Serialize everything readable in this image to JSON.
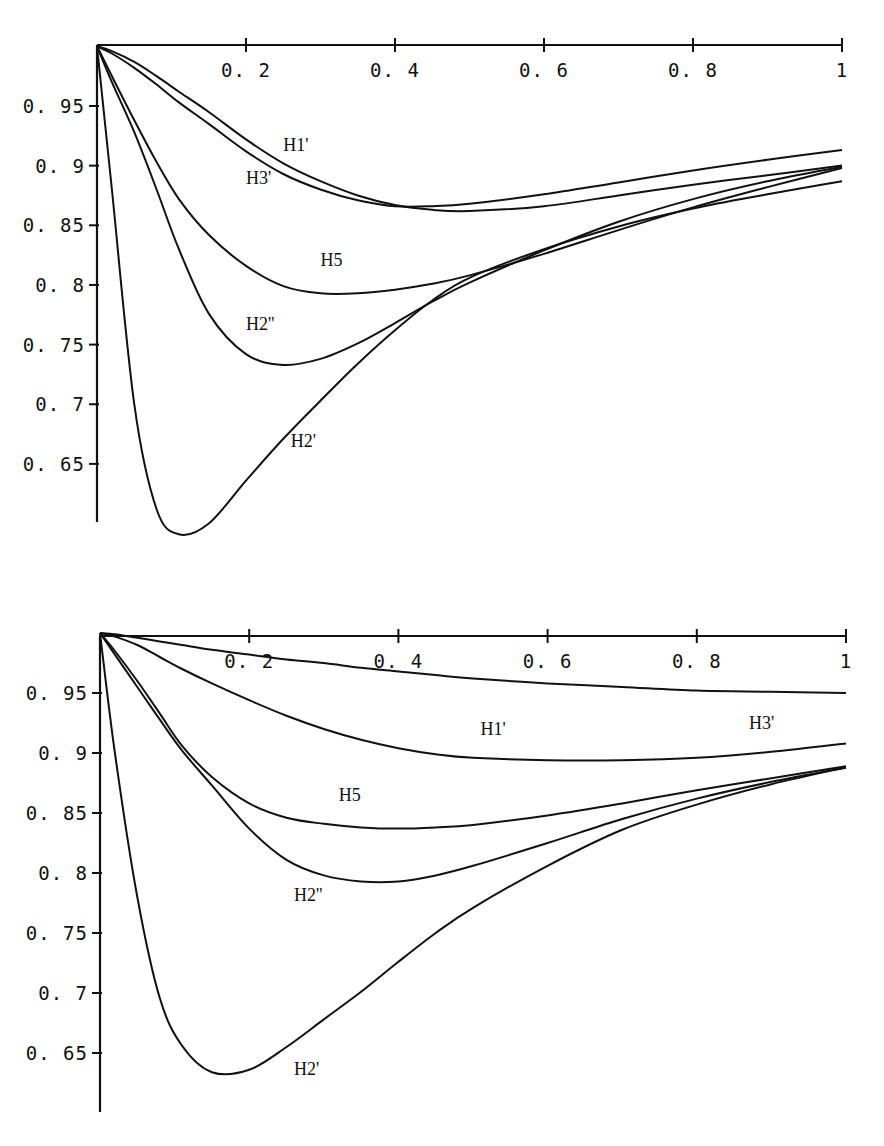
{
  "chart_data": [
    {
      "type": "line",
      "title": "",
      "xlabel": "",
      "ylabel": "",
      "xlim": [
        0,
        1
      ],
      "ylim": [
        0.6,
        1.0
      ],
      "grid": false,
      "legend": "inline labels",
      "x_ticks": [
        "0.2",
        "0.4",
        "0.6",
        "0.8",
        "1"
      ],
      "y_ticks": [
        "0.95",
        "0.9",
        "0.85",
        "0.8",
        "0.75",
        "0.7",
        "0.65"
      ],
      "x": [
        0,
        0.02,
        0.05,
        0.08,
        0.11,
        0.15,
        0.2,
        0.25,
        0.3,
        0.35,
        0.4,
        0.45,
        0.5,
        0.6,
        0.7,
        0.8,
        0.9,
        1.0
      ],
      "series": [
        {
          "name": "H1'",
          "label": "H1'",
          "label_pos": [
            0.25,
            0.912
          ],
          "values": [
            1.0,
            0.996,
            0.987,
            0.975,
            0.962,
            0.945,
            0.922,
            0.902,
            0.887,
            0.875,
            0.867,
            0.863,
            0.862,
            0.866,
            0.875,
            0.884,
            0.892,
            0.9
          ]
        },
        {
          "name": "H3'",
          "label": "H3'",
          "label_pos": [
            0.2,
            0.885
          ],
          "values": [
            1.0,
            0.994,
            0.982,
            0.968,
            0.953,
            0.935,
            0.912,
            0.893,
            0.88,
            0.871,
            0.866,
            0.866,
            0.868,
            0.876,
            0.886,
            0.896,
            0.905,
            0.913
          ]
        },
        {
          "name": "H5",
          "label": "H5",
          "label_pos": [
            0.3,
            0.816
          ],
          "values": [
            1.0,
            0.975,
            0.938,
            0.903,
            0.872,
            0.842,
            0.816,
            0.799,
            0.793,
            0.793,
            0.796,
            0.801,
            0.808,
            0.826,
            0.846,
            0.865,
            0.882,
            0.898
          ]
        },
        {
          "name": "H2''",
          "label": "H2''",
          "label_pos": [
            0.2,
            0.762
          ],
          "values": [
            1.0,
            0.97,
            0.928,
            0.88,
            0.83,
            0.776,
            0.742,
            0.733,
            0.738,
            0.751,
            0.768,
            0.786,
            0.802,
            0.829,
            0.853,
            0.872,
            0.887,
            0.899
          ]
        },
        {
          "name": "H2'",
          "label": "H2'",
          "label_pos": [
            0.26,
            0.664
          ],
          "values": [
            1.0,
            0.88,
            0.7,
            0.612,
            0.591,
            0.6,
            0.636,
            0.671,
            0.703,
            0.734,
            0.762,
            0.787,
            0.806,
            0.83,
            0.849,
            0.864,
            0.876,
            0.887
          ]
        }
      ]
    },
    {
      "type": "line",
      "title": "",
      "xlabel": "",
      "ylabel": "",
      "xlim": [
        0,
        1
      ],
      "ylim": [
        0.6,
        1.0
      ],
      "grid": false,
      "legend": "inline labels",
      "x_ticks": [
        "0.2",
        "0.4",
        "0.6",
        "0.8",
        "1"
      ],
      "y_ticks": [
        "0.95",
        "0.9",
        "0.85",
        "0.8",
        "0.75",
        "0.7",
        "0.65"
      ],
      "x": [
        0,
        0.02,
        0.05,
        0.08,
        0.11,
        0.15,
        0.2,
        0.25,
        0.3,
        0.35,
        0.4,
        0.45,
        0.5,
        0.6,
        0.7,
        0.8,
        0.9,
        1.0
      ],
      "series": [
        {
          "name": "H3'",
          "label": "H3'",
          "label_pos": [
            0.87,
            0.92
          ],
          "values": [
            1.0,
            0.999,
            0.996,
            0.993,
            0.99,
            0.986,
            0.982,
            0.978,
            0.975,
            0.971,
            0.968,
            0.965,
            0.962,
            0.958,
            0.955,
            0.952,
            0.951,
            0.95
          ]
        },
        {
          "name": "H1'",
          "label": "H1'",
          "label_pos": [
            0.51,
            0.915
          ],
          "values": [
            1.0,
            0.997,
            0.99,
            0.98,
            0.97,
            0.958,
            0.944,
            0.931,
            0.92,
            0.911,
            0.904,
            0.899,
            0.896,
            0.894,
            0.894,
            0.896,
            0.901,
            0.908
          ]
        },
        {
          "name": "H5",
          "label": "H5",
          "label_pos": [
            0.32,
            0.86
          ],
          "values": [
            1.0,
            0.985,
            0.96,
            0.933,
            0.906,
            0.88,
            0.858,
            0.846,
            0.841,
            0.838,
            0.837,
            0.838,
            0.84,
            0.848,
            0.858,
            0.869,
            0.879,
            0.889
          ]
        },
        {
          "name": "H2''",
          "label": "H2''",
          "label_pos": [
            0.26,
            0.777
          ],
          "values": [
            1.0,
            0.982,
            0.955,
            0.928,
            0.902,
            0.873,
            0.837,
            0.811,
            0.798,
            0.793,
            0.793,
            0.798,
            0.806,
            0.825,
            0.845,
            0.862,
            0.876,
            0.888
          ]
        },
        {
          "name": "H2'",
          "label": "H2'",
          "label_pos": [
            0.26,
            0.632
          ],
          "values": [
            1.0,
            0.9,
            0.78,
            0.696,
            0.656,
            0.634,
            0.636,
            0.655,
            0.678,
            0.701,
            0.726,
            0.75,
            0.771,
            0.806,
            0.836,
            0.857,
            0.874,
            0.888
          ]
        }
      ]
    }
  ],
  "plots": [
    {
      "x_tick_labels": [
        "0.2",
        "0.4",
        "0.6",
        "0.8",
        "1"
      ],
      "y_tick_labels": [
        "0.95",
        "0.9",
        "0.85",
        "0.8",
        "0.75",
        "0.7",
        "0.65"
      ]
    },
    {
      "x_tick_labels": [
        "0.2",
        "0.4",
        "0.6",
        "0.8",
        "1"
      ],
      "y_tick_labels": [
        "0.95",
        "0.9",
        "0.85",
        "0.8",
        "0.75",
        "0.7",
        "0.65"
      ]
    }
  ]
}
